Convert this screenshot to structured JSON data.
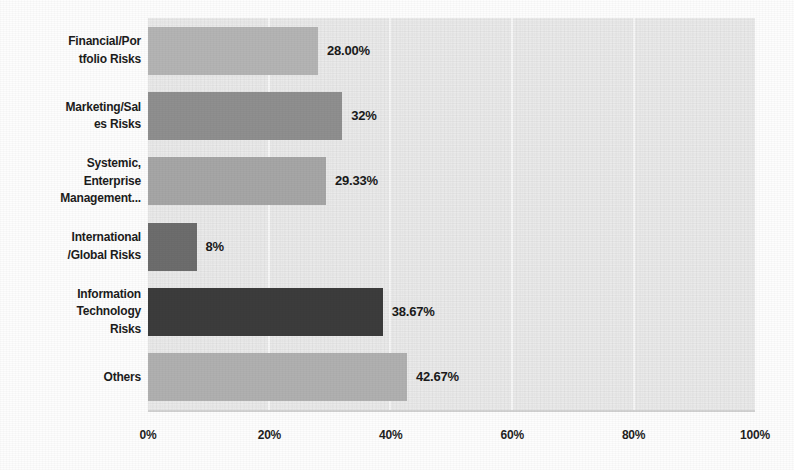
{
  "chart_data": {
    "type": "bar",
    "orientation": "horizontal",
    "title": "",
    "subtitle": "",
    "xlabel": "",
    "ylabel": "",
    "xlim": [
      0,
      100
    ],
    "grid": true,
    "legend": "none",
    "categories": [
      "Financial/Por tfolio Risks",
      "Marketing/Sal es Risks",
      "Systemic, Enterprise Management...",
      "International /Global Risks",
      "Information Technology Risks",
      "Others"
    ],
    "values": [
      28.0,
      32.0,
      29.33,
      8.0,
      38.67,
      42.67
    ],
    "value_labels": [
      "28.00%",
      "32%",
      "29.33%",
      "8%",
      "38.67%",
      "42.67%"
    ],
    "xticks": [
      0,
      20,
      40,
      60,
      80,
      100
    ],
    "xtick_labels": [
      "0%",
      "20%",
      "40%",
      "60%",
      "80%",
      "100%"
    ],
    "bar_colors": [
      "#b4b4b4",
      "#8f8f8f",
      "#a6a6a6",
      "#6d6d6d",
      "#3c3c3c",
      "#b0b0b0"
    ],
    "plot_background": "#eaeaea",
    "gridline_color": "#f6f6f6"
  },
  "axis": {
    "x_ticks": [
      {
        "label": "0%",
        "value": 0
      },
      {
        "label": "20%",
        "value": 20
      },
      {
        "label": "40%",
        "value": 40
      },
      {
        "label": "60%",
        "value": 60
      },
      {
        "label": "80%",
        "value": 80
      },
      {
        "label": "100%",
        "value": 100
      }
    ]
  },
  "categories": [
    {
      "lines": [
        "Financial/Por",
        "tfolio Risks"
      ],
      "value_label": "28.00%",
      "value": 28.0,
      "color": "#b4b4b4"
    },
    {
      "lines": [
        "Marketing/Sal",
        "es Risks"
      ],
      "value_label": "32%",
      "value": 32.0,
      "color": "#8f8f8f"
    },
    {
      "lines": [
        "Systemic,",
        "Enterprise",
        "Management..."
      ],
      "value_label": "29.33%",
      "value": 29.33,
      "color": "#a6a6a6"
    },
    {
      "lines": [
        "International",
        "/Global Risks"
      ],
      "value_label": "8%",
      "value": 8.0,
      "color": "#6d6d6d"
    },
    {
      "lines": [
        "Information",
        "Technology",
        "Risks"
      ],
      "value_label": "38.67%",
      "value": 38.67,
      "color": "#3c3c3c"
    },
    {
      "lines": [
        "Others"
      ],
      "value_label": "42.67%",
      "value": 42.67,
      "color": "#b0b0b0"
    }
  ]
}
